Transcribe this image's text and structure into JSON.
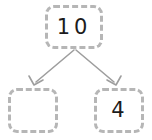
{
  "diagram": {
    "type": "number-bond-part-whole",
    "accent_color": "#b6b6b6",
    "text_color": "#1c1c1c",
    "background_color": "#ffffff",
    "arrow_color": "#9e9e9e",
    "nodes": [
      {
        "id": "whole",
        "role": "whole",
        "value": "10",
        "filled": true,
        "position": "top-center"
      },
      {
        "id": "part-left",
        "role": "part",
        "value": "",
        "filled": false,
        "position": "bottom-left"
      },
      {
        "id": "part-right",
        "role": "part",
        "value": "4",
        "filled": true,
        "position": "bottom-right"
      }
    ],
    "arrows": [
      {
        "id": "arrow-whole-to-left",
        "from": "whole",
        "to": "part-left",
        "direction": "down-left"
      },
      {
        "id": "arrow-whole-to-right",
        "from": "whole",
        "to": "part-right",
        "direction": "down-right"
      }
    ]
  }
}
